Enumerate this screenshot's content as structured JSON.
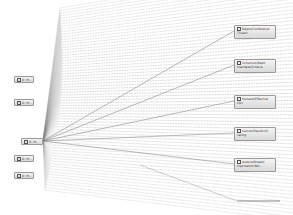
{
  "diagram": {
    "type": "fan-out dependency graph",
    "colors": {
      "line": "#8a8a8a",
      "node_border": "#9a9a9a",
      "node_fill": "#e6e6e6"
    },
    "hub": {
      "label": "D. Hi...",
      "x": 21,
      "y": 138,
      "w": 22,
      "h": 7
    },
    "left_nodes": [
      {
        "label": "D. Hi...",
        "x": 14,
        "y": 76
      },
      {
        "label": "D. Hi...",
        "x": 14,
        "y": 99
      },
      {
        "label": "D. Hi...",
        "x": 14,
        "y": 155
      },
      {
        "label": "D. Hi...",
        "x": 14,
        "y": 172
      }
    ],
    "right_nodes": [
      {
        "label": "Reject/Conference Tilsiam",
        "x": 234,
        "y": 25
      },
      {
        "label": "Construct/Redit mandate/Criteria",
        "x": 234,
        "y": 59
      },
      {
        "label": "Humant/Effective tion",
        "x": 234,
        "y": 95
      },
      {
        "label": "Cancel/Plan/Archi valing",
        "x": 234,
        "y": 127
      },
      {
        "label": "Audure/Breakt/ mportation/Nor...",
        "x": 234,
        "y": 158
      }
    ],
    "bottom_edge_end": {
      "x": 280,
      "y": 201
    },
    "fan_line_count": 70
  }
}
